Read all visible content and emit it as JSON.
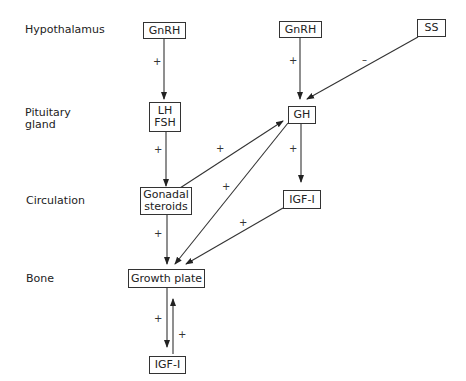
{
  "levels": [
    {
      "label": "Hypothalamus"
    },
    {
      "label": "Pituitary\ngland",
      "line1": "Pituitary",
      "line2": "gland"
    },
    {
      "label": "Circulation"
    },
    {
      "label": "Bone"
    }
  ],
  "nodes": {
    "gnrh_left": {
      "label": "GnRH"
    },
    "gnrh_right": {
      "label": "GnRH"
    },
    "ss": {
      "label": "SS"
    },
    "lh_fsh": {
      "line1": "LH",
      "line2": "FSH"
    },
    "gh": {
      "label": "GH"
    },
    "gonadal_steroids": {
      "line1": "Gonadal",
      "line2": "steroids"
    },
    "igf1_circulation": {
      "label": "IGF-I"
    },
    "growth_plate": {
      "label": "Growth plate"
    },
    "igf1_bone": {
      "label": "IGF-I"
    }
  },
  "edges": [
    {
      "from": "GnRH (left)",
      "to": "LH/FSH",
      "sign": "+"
    },
    {
      "from": "GnRH (right)",
      "to": "GH",
      "sign": "+"
    },
    {
      "from": "SS",
      "to": "GH",
      "sign": "–"
    },
    {
      "from": "LH/FSH",
      "to": "Gonadal steroids",
      "sign": "+"
    },
    {
      "from": "Gonadal steroids",
      "to": "GH",
      "sign": "+"
    },
    {
      "from": "GH",
      "to": "IGF-I (circulation)",
      "sign": "+"
    },
    {
      "from": "GH",
      "to": "Growth plate",
      "sign": "+"
    },
    {
      "from": "Gonadal steroids",
      "to": "Growth plate",
      "sign": "+"
    },
    {
      "from": "IGF-I (circulation)",
      "to": "Growth plate",
      "sign": "+"
    },
    {
      "from": "Growth plate",
      "to": "IGF-I (bone)",
      "sign": "+"
    },
    {
      "from": "IGF-I (bone)",
      "to": "Growth plate",
      "sign": "+"
    }
  ],
  "signs": {
    "plus": "+",
    "minus": "–"
  }
}
